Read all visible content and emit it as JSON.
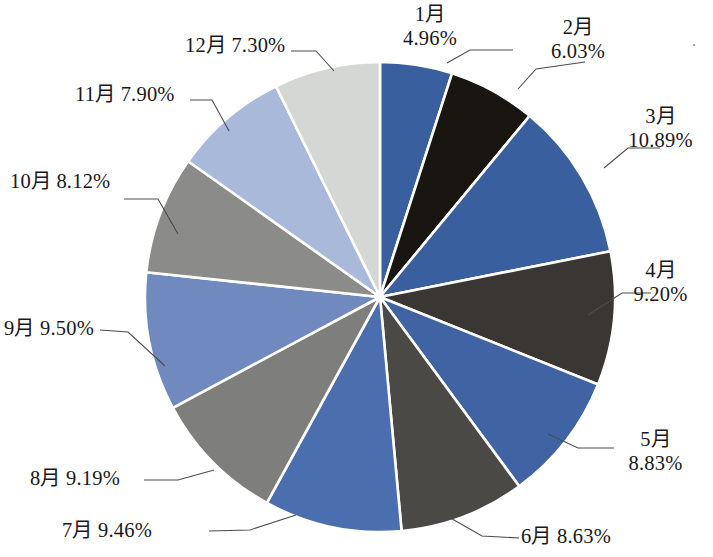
{
  "chart_data": {
    "type": "pie",
    "title": "",
    "subtitle": "",
    "xlabel": "",
    "ylabel": "",
    "legend_position": "none",
    "grid": false,
    "start_angle_deg": 0,
    "direction": "clockwise",
    "unit": "%",
    "categories": [
      "1月",
      "2月",
      "3月",
      "4月",
      "5月",
      "6月",
      "7月",
      "8月",
      "9月",
      "10月",
      "11月",
      "12月"
    ],
    "values": [
      4.96,
      6.03,
      10.89,
      9.2,
      8.83,
      8.63,
      9.46,
      9.19,
      9.5,
      8.12,
      7.9,
      7.3
    ],
    "value_labels": [
      "4.96%",
      "6.03%",
      "10.89%",
      "9.20%",
      "8.83%",
      "8.63%",
      "9.46%",
      "9.19%",
      "9.50%",
      "8.12%",
      "7.90%",
      "7.30%"
    ],
    "colors": [
      "#3a5f9e",
      "#191511",
      "#3a5f9e",
      "#393633",
      "#3f63a3",
      "#4b4946",
      "#4a6eae",
      "#7e7e7c",
      "#7089bf",
      "#8b8b89",
      "#a9b9d9",
      "#d5d7d5"
    ],
    "slice_border_color": "#ffffff",
    "slices": [
      {
        "label": "1月",
        "value": 4.96,
        "display": "1月\n4.96%",
        "color": "#3a5f9e"
      },
      {
        "label": "2月",
        "value": 6.03,
        "display": "2月\n6.03%",
        "color": "#191511"
      },
      {
        "label": "3月",
        "value": 10.89,
        "display": "3月\n10.89%",
        "color": "#3a5f9e"
      },
      {
        "label": "4月",
        "value": 9.2,
        "display": "4月\n9.20%",
        "color": "#393633"
      },
      {
        "label": "5月",
        "value": 8.83,
        "display": "5月\n8.83%",
        "color": "#3f63a3"
      },
      {
        "label": "6月",
        "value": 8.63,
        "display": "6月 8.63%",
        "color": "#4b4946"
      },
      {
        "label": "7月",
        "value": 9.46,
        "display": "7月 9.46%",
        "color": "#4a6eae"
      },
      {
        "label": "8月",
        "value": 9.19,
        "display": "8月 9.19%",
        "color": "#7e7e7c"
      },
      {
        "label": "9月",
        "value": 9.5,
        "display": "9月 9.50%",
        "color": "#7089bf"
      },
      {
        "label": "10月",
        "value": 8.12,
        "display": "10月 8.12%",
        "color": "#8b8b89"
      },
      {
        "label": "11月",
        "value": 7.9,
        "display": "11月 7.90%",
        "color": "#a9b9d9"
      },
      {
        "label": "12月",
        "value": 7.3,
        "display": "12月 7.30%",
        "color": "#d5d7d5"
      }
    ]
  },
  "labels": {
    "jan_line1": "1月",
    "jan_line2": "4.96%",
    "feb_line1": "2月",
    "feb_line2": "6.03%",
    "mar_line1": "3月",
    "mar_line2": "10.89%",
    "apr_line1": "4月",
    "apr_line2": "9.20%",
    "may_line1": "5月",
    "may_line2": "8.83%",
    "jun": "6月 8.63%",
    "jul": "7月 9.46%",
    "aug": "8月 9.19%",
    "sep": "9月 9.50%",
    "oct": "10月 8.12%",
    "nov": "11月 7.90%",
    "dec": "12月 7.30%"
  }
}
